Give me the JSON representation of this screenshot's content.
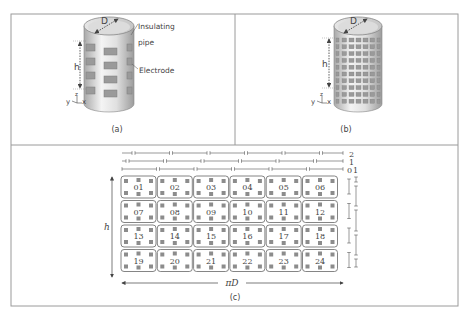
{
  "panels": {
    "a": {
      "caption": "(a)",
      "labels": {
        "diameter": "D",
        "height": "h",
        "insulating_line1": "Insulating",
        "insulating_line2": "pipe",
        "electrode": "Electrode",
        "axis_y": "y",
        "axis_z": "z",
        "axis_x": "x"
      },
      "electrode_rows": 4
    },
    "b": {
      "caption": "(b)",
      "labels": {
        "diameter": "D",
        "height": "h",
        "axis_y": "y",
        "axis_z": "z",
        "axis_x": "x"
      },
      "electrode_rows": 10
    },
    "c": {
      "caption": "(c)",
      "height_label": "h",
      "width_label": "πD",
      "layer_labels": {
        "l2": "2",
        "l1": "1",
        "l0": "0",
        "l0b": "1"
      },
      "cells": [
        "01",
        "02",
        "03",
        "04",
        "05",
        "06",
        "07",
        "08",
        "09",
        "10",
        "11",
        "12",
        "13",
        "14",
        "15",
        "16",
        "17",
        "18",
        "19",
        "20",
        "21",
        "22",
        "23",
        "24"
      ],
      "rows": 4,
      "cols": 6
    }
  },
  "colors": {
    "frame": "#9a9a9a",
    "line": "#555555",
    "pad": "#8c8c8c",
    "cylinder_light": "#f2f2f2",
    "cylinder_dark": "#b9b9b9"
  }
}
